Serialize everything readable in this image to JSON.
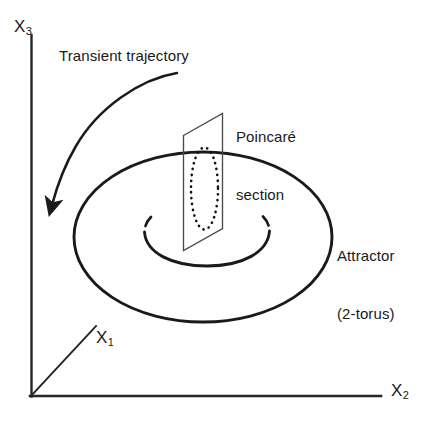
{
  "figure": {
    "kind": "line-diagram",
    "background_color": "#ffffff",
    "stroke_color": "#1a1a1a"
  },
  "axes": {
    "vertical": {
      "name": "x3-axis",
      "label": "X",
      "subscript": "3"
    },
    "horizontal": {
      "name": "x2-axis",
      "label": "X",
      "subscript": "2"
    },
    "depth": {
      "name": "x1-axis",
      "label": "X",
      "subscript": "1"
    }
  },
  "annotations": {
    "transient": {
      "text": "Transient trajectory",
      "icon": "curved-arrow-icon"
    },
    "poincare": {
      "line1": "Poincaré",
      "line2": "section"
    },
    "attractor": {
      "line1": "Attractor",
      "line2": "(2-torus)"
    }
  },
  "shapes": {
    "outer_torus": "ellipse",
    "inner_hole": "ellipse-broken",
    "section_plane": "parallelogram",
    "section_curve": "dotted-ellipse"
  }
}
